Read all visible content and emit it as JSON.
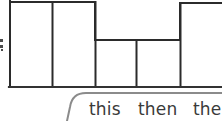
{
  "scene": {
    "title": "Handwritten bar chart with caption strip",
    "background_color": "#ffffff",
    "stroke_color": "#2b2b2b",
    "callout_stroke_color": "#8b8b8b",
    "text_color": "#3a3a3a"
  },
  "axis": {
    "left_label_fragment": ".",
    "baseline_present": true
  },
  "caption": {
    "words": [
      {
        "text": "this"
      },
      {
        "text": "then"
      },
      {
        "text": "the"
      }
    ],
    "full_text": "this  then  the",
    "clipped_right": true
  },
  "chart_data": {
    "type": "bar",
    "title": "",
    "subtitle": "",
    "xlabel": "",
    "ylabel": "",
    "categories": [
      "1",
      "2",
      "3",
      "4",
      "5"
    ],
    "values": [
      100,
      100,
      55,
      55,
      98
    ],
    "ylim": [
      0,
      100
    ],
    "grid": false,
    "legend": null,
    "bar_geometry_px": [
      {
        "x": 10,
        "width": 42,
        "top": 2,
        "bottom": 87
      },
      {
        "x": 52,
        "width": 43,
        "top": 2,
        "bottom": 87
      },
      {
        "x": 95,
        "width": 41,
        "top": 40,
        "bottom": 87
      },
      {
        "x": 136,
        "width": 44,
        "top": 40,
        "bottom": 87
      },
      {
        "x": 180,
        "width": 42,
        "top": 3,
        "bottom": 87
      }
    ],
    "baseline_y_px": 87
  }
}
